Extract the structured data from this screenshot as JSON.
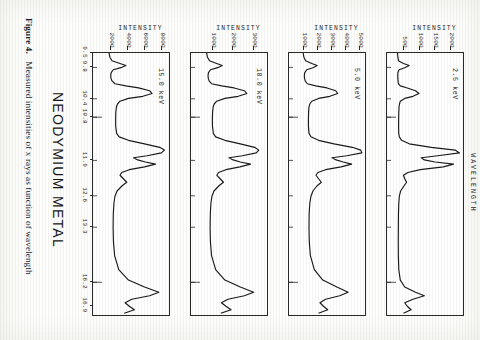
{
  "figure": {
    "title": "NEODYMIUM METAL",
    "caption_label": "Figure 4.",
    "caption_text": "Measured intensities of x rays as function of wavelength",
    "x_axis_label": "WAVELENGTH",
    "y_axis_label": "INTENSITY"
  },
  "chart_data": {
    "type": "line",
    "title": "NEODYMIUM METAL",
    "subtitle": "Figure 4. Measured intensities of x rays as function of wavelength",
    "xlabel": "WAVELENGTH",
    "ylabel": "INTENSITY",
    "grid": false,
    "legend": "none",
    "xtick_labels": [
      "9.5",
      "9.8",
      "10.4",
      "10.8",
      "11.9",
      "12.6",
      "13.3",
      "16.2",
      "16.9"
    ],
    "xtick_positions": [
      0.0,
      0.055,
      0.175,
      0.245,
      0.41,
      0.545,
      0.665,
      0.875,
      0.965
    ],
    "xlim": [
      9.5,
      17.0
    ],
    "panels": [
      {
        "id": "panel-2p5kev",
        "energy_label": "2.5 keV",
        "ylabel": "INTENSITY",
        "ylim": [
          0,
          2400
        ],
        "ytick_labels": [
          "500",
          "1000",
          "1500",
          "2000"
        ],
        "ytick_values": [
          500,
          1000,
          1500,
          2000
        ],
        "x": [
          9.5,
          9.62,
          9.72,
          9.8,
          9.86,
          9.92,
          9.98,
          10.06,
          10.14,
          10.22,
          10.3,
          10.38,
          10.44,
          10.5,
          10.58,
          10.66,
          10.74,
          10.8,
          10.88,
          10.96,
          11.04,
          11.2,
          11.4,
          11.6,
          11.8,
          11.9,
          12.0,
          12.1,
          12.2,
          12.28,
          12.36,
          12.44,
          12.5,
          12.56,
          12.62,
          12.68,
          12.76,
          12.84,
          12.92,
          13.0,
          13.1,
          13.2,
          13.3,
          13.45,
          13.6,
          13.8,
          14.1,
          14.5,
          14.9,
          15.3,
          15.7,
          16.0,
          16.2,
          16.35,
          16.45,
          16.55,
          16.65,
          16.75,
          16.85,
          16.95
        ],
        "y": [
          330,
          345,
          360,
          520,
          700,
          560,
          380,
          345,
          340,
          342,
          348,
          360,
          420,
          640,
          900,
          1010,
          820,
          560,
          420,
          395,
          380,
          372,
          368,
          366,
          370,
          390,
          460,
          700,
          1400,
          2150,
          2290,
          1600,
          1080,
          1180,
          1520,
          2100,
          1780,
          1050,
          660,
          520,
          560,
          620,
          540,
          430,
          390,
          372,
          362,
          358,
          356,
          358,
          372,
          420,
          560,
          900,
          1180,
          820,
          560,
          640,
          760,
          520
        ]
      },
      {
        "id": "panel-5kev",
        "energy_label": "5.0 keV",
        "ylabel": "INTENSITY",
        "ylim": [
          0,
          5400
        ],
        "ytick_labels": [
          "1000",
          "2000",
          "3000",
          "4000",
          "5000"
        ],
        "ytick_values": [
          1000,
          2000,
          3000,
          4000,
          5000
        ],
        "x": [
          9.5,
          9.62,
          9.72,
          9.8,
          9.86,
          9.92,
          9.98,
          10.06,
          10.14,
          10.22,
          10.3,
          10.38,
          10.44,
          10.5,
          10.58,
          10.66,
          10.74,
          10.8,
          10.88,
          10.96,
          11.04,
          11.2,
          11.4,
          11.6,
          11.8,
          11.9,
          12.0,
          12.1,
          12.2,
          12.28,
          12.36,
          12.44,
          12.5,
          12.56,
          12.62,
          12.68,
          12.76,
          12.84,
          12.92,
          13.0,
          13.1,
          13.2,
          13.3,
          13.45,
          13.6,
          13.8,
          14.1,
          14.5,
          14.9,
          15.3,
          15.7,
          16.0,
          16.2,
          16.35,
          16.45,
          16.55,
          16.65,
          16.75,
          16.85,
          16.95
        ],
        "y": [
          1000,
          1060,
          1180,
          1620,
          2000,
          1700,
          1260,
          1120,
          1090,
          1100,
          1150,
          1300,
          1900,
          2700,
          3320,
          3460,
          2900,
          2100,
          1620,
          1480,
          1420,
          1390,
          1380,
          1380,
          1420,
          1560,
          2100,
          3200,
          4500,
          5100,
          5180,
          4100,
          3050,
          3350,
          3850,
          4450,
          3700,
          2600,
          2050,
          1920,
          2100,
          2300,
          2000,
          1700,
          1560,
          1480,
          1430,
          1420,
          1440,
          1520,
          1800,
          2400,
          3400,
          4200,
          3600,
          2600,
          2200,
          2450,
          2750,
          2100
        ]
      },
      {
        "id": "panel-10kev",
        "energy_label": "10.0 keV",
        "ylabel": "INTENSITY",
        "ylim": [
          0,
          3700
        ],
        "ytick_labels": [
          "1000",
          "2000",
          "3000"
        ],
        "ytick_values": [
          1000,
          2000,
          3000
        ],
        "x": [
          9.5,
          9.62,
          9.72,
          9.8,
          9.86,
          9.92,
          9.98,
          10.06,
          10.14,
          10.22,
          10.3,
          10.38,
          10.44,
          10.5,
          10.58,
          10.66,
          10.74,
          10.8,
          10.88,
          10.96,
          11.04,
          11.2,
          11.4,
          11.6,
          11.8,
          11.9,
          12.0,
          12.1,
          12.2,
          12.28,
          12.36,
          12.44,
          12.5,
          12.56,
          12.62,
          12.68,
          12.76,
          12.84,
          12.92,
          13.0,
          13.1,
          13.2,
          13.3,
          13.45,
          13.6,
          13.8,
          14.1,
          14.5,
          14.9,
          15.3,
          15.7,
          16.0,
          16.2,
          16.35,
          16.45,
          16.55,
          16.65,
          16.75,
          16.85,
          16.95
        ],
        "y": [
          760,
          800,
          900,
          1250,
          1520,
          1300,
          950,
          850,
          830,
          840,
          880,
          1000,
          1500,
          2100,
          2600,
          2720,
          2300,
          1650,
          1250,
          1130,
          1080,
          1050,
          1040,
          1045,
          1090,
          1200,
          1650,
          2400,
          3100,
          3300,
          3180,
          2500,
          1850,
          2050,
          2400,
          2900,
          2380,
          1700,
          1340,
          1260,
          1420,
          1580,
          1360,
          1120,
          1020,
          970,
          940,
          930,
          945,
          1000,
          1200,
          1650,
          2400,
          3050,
          2600,
          1800,
          1480,
          1700,
          1950,
          1450
        ]
      },
      {
        "id": "panel-15kev",
        "energy_label": "15.0 keV",
        "ylabel": "INTENSITY",
        "ylim": [
          0,
          9000
        ],
        "ytick_labels": [
          "2000",
          "4000",
          "6000",
          "8000"
        ],
        "ytick_values": [
          2000,
          4000,
          6000,
          8000
        ],
        "x": [
          9.5,
          9.62,
          9.72,
          9.8,
          9.86,
          9.92,
          9.98,
          10.06,
          10.14,
          10.22,
          10.3,
          10.38,
          10.44,
          10.5,
          10.58,
          10.66,
          10.74,
          10.8,
          10.88,
          10.96,
          11.04,
          11.2,
          11.4,
          11.6,
          11.8,
          11.9,
          12.0,
          12.1,
          12.2,
          12.28,
          12.36,
          12.44,
          12.5,
          12.56,
          12.62,
          12.68,
          12.76,
          12.84,
          12.92,
          13.0,
          13.1,
          13.2,
          13.3,
          13.45,
          13.6,
          13.8,
          14.1,
          14.5,
          14.9,
          15.3,
          15.7,
          16.0,
          16.2,
          16.35,
          16.45,
          16.55,
          16.65,
          16.75,
          16.85,
          16.95
        ],
        "y": [
          1900,
          2000,
          2250,
          3200,
          3900,
          3300,
          2400,
          2150,
          2100,
          2120,
          2250,
          2600,
          3900,
          5400,
          6700,
          7000,
          5900,
          4200,
          3200,
          2900,
          2780,
          2700,
          2680,
          2690,
          2800,
          3100,
          4200,
          6100,
          7900,
          8450,
          8100,
          6400,
          4800,
          5300,
          6200,
          7400,
          6100,
          4300,
          3400,
          3200,
          3600,
          4000,
          3450,
          2850,
          2600,
          2480,
          2400,
          2380,
          2420,
          2560,
          3050,
          4200,
          6100,
          7800,
          6700,
          4600,
          3800,
          4300,
          4900,
          3700
        ]
      }
    ]
  }
}
